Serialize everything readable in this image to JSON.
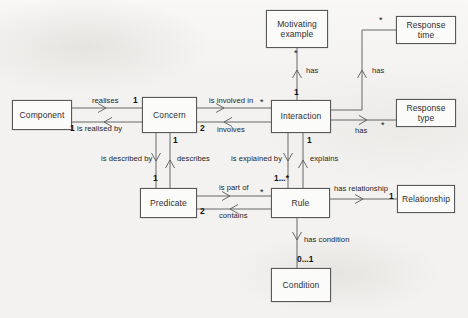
{
  "diagram": {
    "background_color": "#f3f2f0",
    "line_color": "#58585a",
    "text_color": "#2e2e30"
  },
  "nodes": [
    {
      "id": "component",
      "label": "Component",
      "x": 12,
      "y": 100,
      "w": 60,
      "h": 30
    },
    {
      "id": "concern",
      "label": "Concern",
      "x": 142,
      "y": 97,
      "w": 55,
      "h": 36
    },
    {
      "id": "interaction",
      "label": "Interaction",
      "x": 271,
      "y": 100,
      "w": 60,
      "h": 33
    },
    {
      "id": "motivating-example",
      "label": "Motivating example",
      "x": 266,
      "y": 10,
      "w": 62,
      "h": 38
    },
    {
      "id": "response-time",
      "label": "Response time",
      "x": 396,
      "y": 16,
      "w": 60,
      "h": 28
    },
    {
      "id": "response-type",
      "label": "Response type",
      "x": 396,
      "y": 99,
      "w": 60,
      "h": 28
    },
    {
      "id": "predicate",
      "label": "Predicate",
      "x": 140,
      "y": 188,
      "w": 57,
      "h": 30
    },
    {
      "id": "rule",
      "label": "Rule",
      "x": 271,
      "y": 188,
      "w": 59,
      "h": 30
    },
    {
      "id": "relationship",
      "label": "Relationship",
      "x": 397,
      "y": 185,
      "w": 58,
      "h": 28
    },
    {
      "id": "condition",
      "label": "Condition",
      "x": 271,
      "y": 268,
      "w": 60,
      "h": 34
    }
  ],
  "associations": [
    {
      "id": "realises",
      "label": "realises",
      "from": "component",
      "to": "concern"
    },
    {
      "id": "is-realised-by",
      "label": "is realised by",
      "from": "concern",
      "to": "component"
    },
    {
      "id": "is-involved-in",
      "label": "is involved in",
      "from": "concern",
      "to": "interaction"
    },
    {
      "id": "involves",
      "label": "involves",
      "from": "interaction",
      "to": "concern"
    },
    {
      "id": "has-motivating",
      "label": "has",
      "from": "interaction",
      "to": "motivating-example"
    },
    {
      "id": "has-response-time",
      "label": "has",
      "from": "interaction",
      "to": "response-time"
    },
    {
      "id": "has-response-type",
      "label": "has",
      "from": "interaction",
      "to": "response-type"
    },
    {
      "id": "is-described-by",
      "label": "is described by",
      "from": "concern",
      "to": "predicate"
    },
    {
      "id": "describes",
      "label": "describes",
      "from": "predicate",
      "to": "concern"
    },
    {
      "id": "is-explained-by",
      "label": "is explained by",
      "from": "interaction",
      "to": "rule"
    },
    {
      "id": "explains",
      "label": "explains",
      "from": "rule",
      "to": "interaction"
    },
    {
      "id": "is-part-of",
      "label": "is part of",
      "from": "predicate",
      "to": "rule"
    },
    {
      "id": "contains",
      "label": "contains",
      "from": "rule",
      "to": "predicate"
    },
    {
      "id": "has-relationship",
      "label": "has relationship",
      "from": "rule",
      "to": "relationship"
    },
    {
      "id": "has-condition",
      "label": "has condition",
      "from": "rule",
      "to": "condition"
    }
  ],
  "labels": {
    "realises": "realises",
    "is_realised_by": "is realised by",
    "is_involved_in": "is involved in",
    "involves": "involves",
    "has_motivating": "has",
    "has_response_time": "has",
    "has_response_type": "has",
    "is_described_by": "is described by",
    "describes": "describes",
    "is_explained_by": "is explained by",
    "explains": "explains",
    "is_part_of": "is part of",
    "contains": "contains",
    "has_relationship": "has relationship",
    "has_condition": "has condition"
  },
  "multiplicities": {
    "concern_realises": "1",
    "component_realised_by": "1",
    "concern_involves": "2",
    "interaction_involved_in": "*",
    "interaction_has_motivating": "1",
    "motivating_star": "*",
    "response_time_star": "*",
    "response_type_star": "*",
    "concern_describes": "1",
    "predicate_described_by": "1",
    "interaction_explains": "1",
    "rule_explained_by": "1...*",
    "predicate_contains": "2",
    "rule_is_part_of": "*",
    "relationship_one": "1",
    "condition_zero_one": "0...1"
  }
}
